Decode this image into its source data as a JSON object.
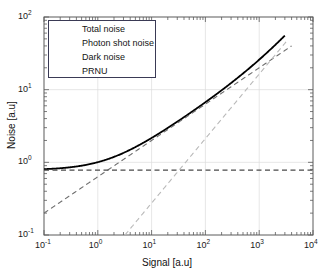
{
  "chart_data": {
    "type": "line",
    "title": "",
    "xlabel": "Signal [a.u]",
    "ylabel": "Noise [a.u]",
    "xscale": "log",
    "yscale": "log",
    "xlim": [
      0.1,
      10000
    ],
    "ylim": [
      0.1,
      100
    ],
    "grid": true,
    "legend_position": "upper-left",
    "xticks": [
      {
        "value": 0.1,
        "label": "10",
        "exp": "-1"
      },
      {
        "value": 1,
        "label": "10",
        "exp": "0"
      },
      {
        "value": 10,
        "label": "10",
        "exp": "1"
      },
      {
        "value": 100,
        "label": "10",
        "exp": "2"
      },
      {
        "value": 1000,
        "label": "10",
        "exp": "3"
      },
      {
        "value": 10000,
        "label": "10",
        "exp": "4"
      }
    ],
    "yticks": [
      {
        "value": 0.1,
        "label": "10",
        "exp": "-1"
      },
      {
        "value": 1,
        "label": "10",
        "exp": "0"
      },
      {
        "value": 10,
        "label": "10",
        "exp": "1"
      },
      {
        "value": 100,
        "label": "10",
        "exp": "2"
      }
    ],
    "series": [
      {
        "name": "Total noise",
        "style": "solid",
        "color": "#000000",
        "width": 1.8,
        "model": "quadrature_sum",
        "x": [
          0.1,
          0.2,
          0.5,
          1,
          2,
          5,
          10,
          20,
          50,
          100,
          200,
          500,
          1000,
          2000,
          3000
        ],
        "y": [
          0.804,
          0.818,
          0.861,
          0.926,
          1.042,
          1.33,
          1.71,
          2.31,
          3.59,
          5.14,
          7.71,
          14.4,
          25.3,
          47.1,
          68.3
        ]
      },
      {
        "name": "Photon shot noise",
        "style": "dashed",
        "color": "#6e6e6e",
        "width": 1.1,
        "model": "sqrt(S)*0.63, slope 0.5",
        "x": [
          0.1,
          1,
          10,
          100,
          1000,
          4000
        ],
        "y": [
          0.2,
          0.63,
          2.0,
          6.3,
          20.0,
          40.0
        ]
      },
      {
        "name": "Dark noise",
        "style": "dashed",
        "color": "#4a4a4a",
        "width": 1.2,
        "model": "constant 0.78",
        "x": [
          0.1,
          10000
        ],
        "y": [
          0.78,
          0.78
        ]
      },
      {
        "name": "PRNU",
        "style": "dashed",
        "color": "#b9b9b9",
        "width": 1.1,
        "model": "0.0145*S, slope 1",
        "x": [
          3.2,
          10,
          100,
          1000,
          3200
        ],
        "y": [
          0.1,
          0.29,
          2.9,
          29.0,
          46.0
        ]
      }
    ]
  },
  "legend": {
    "entries": [
      {
        "label": "Total noise",
        "style": "solid",
        "color": "#000000"
      },
      {
        "label": "Photon shot noise",
        "style": "dashed",
        "color": "#6e6e6e"
      },
      {
        "label": "Dark noise",
        "style": "dashed",
        "color": "#4a4a4a"
      },
      {
        "label": "PRNU",
        "style": "dashed",
        "color": "#b9b9b9"
      }
    ]
  },
  "colors": {
    "frame": "#5a5a5a",
    "grid": "#dcdcdc",
    "text": "#141414",
    "background": "#ffffff"
  }
}
